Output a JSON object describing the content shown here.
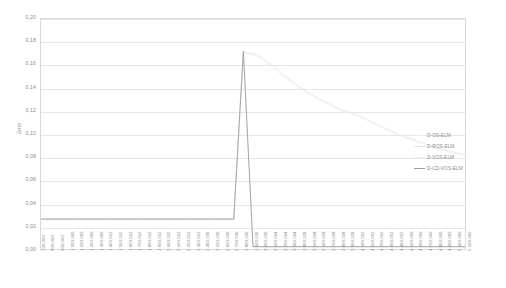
{
  "chart_data": {
    "type": "line",
    "title": "",
    "xlabel": "",
    "ylabel": "Error",
    "ylim": [
      0.0,
      0.2
    ],
    "y_ticks": [
      "0,20",
      "0,18",
      "0,16",
      "0,14",
      "0,12",
      "0,10",
      "0,08",
      "0,06",
      "0,04",
      "0,02",
      "0,00"
    ],
    "y_tick_values": [
      0.2,
      0.18,
      0.16,
      0.14,
      0.12,
      0.1,
      0.08,
      0.06,
      0.04,
      0.02,
      0.0
    ],
    "grid": true,
    "legend_position": "right",
    "decimal_separator": ",",
    "categories": [
      "700,060",
      "800,060",
      "900,060",
      "1.000,060",
      "1.100,060",
      "1.200,060",
      "1.300,060",
      "1.400,012",
      "1.500,012",
      "1.600,012",
      "1.700,012",
      "1.800,012",
      "1.900,012",
      "2.000,012",
      "2.100,012",
      "2.200,012",
      "2.300,012",
      "2.400,036",
      "2.500,036",
      "2.600,036",
      "2.700,036",
      "2.800,036",
      "2.900,036",
      "3.000,036",
      "3.100,004",
      "3.200,004",
      "3.300,004",
      "3.400,028",
      "3.500,028",
      "3.600,028",
      "3.700,028",
      "3.800,028",
      "3.900,028",
      "4.000,052",
      "4.100,052",
      "4.200,052",
      "4.300,052",
      "4.400,052",
      "4.500,000",
      "4.600,000",
      "4.700,000",
      "4.800,000",
      "4.900,060",
      "5.000,060",
      "5.100,060"
    ],
    "series": [
      {
        "name": "D-OS-ELM",
        "color": "#ededed",
        "values": [
          0.026,
          0.026,
          0.026,
          0.026,
          0.026,
          0.026,
          0.026,
          0.026,
          0.026,
          0.026,
          0.026,
          0.026,
          0.026,
          0.026,
          0.026,
          0.026,
          0.026,
          0.026,
          0.026,
          0.026,
          0.026,
          0.172,
          0.002,
          0.002,
          0.002,
          0.002,
          0.002,
          0.002,
          0.002,
          0.002,
          0.002,
          0.002,
          0.002,
          0.002,
          0.002,
          0.002,
          0.002,
          0.002,
          0.002,
          0.002,
          0.002,
          0.002,
          0.002,
          0.002,
          0.002
        ]
      },
      {
        "name": "D-ROS-ELM",
        "color": "#e4e4e4",
        "values": [
          0.026,
          0.026,
          0.026,
          0.026,
          0.026,
          0.026,
          0.026,
          0.026,
          0.026,
          0.026,
          0.026,
          0.026,
          0.026,
          0.026,
          0.026,
          0.026,
          0.026,
          0.026,
          0.026,
          0.026,
          0.026,
          0.171,
          0.17,
          0.166,
          0.16,
          0.153,
          0.146,
          0.14,
          0.135,
          0.13,
          0.126,
          0.122,
          0.119,
          0.116,
          0.112,
          0.108,
          0.104,
          0.1,
          0.097,
          0.094,
          0.091,
          0.088,
          0.086,
          0.084,
          0.082
        ]
      },
      {
        "name": "D-VOS-ELM",
        "color": "#efefef",
        "values": [
          0.026,
          0.026,
          0.026,
          0.026,
          0.026,
          0.026,
          0.026,
          0.026,
          0.026,
          0.026,
          0.026,
          0.026,
          0.026,
          0.026,
          0.026,
          0.026,
          0.026,
          0.026,
          0.026,
          0.026,
          0.026,
          0.17,
          0.169,
          0.165,
          0.158,
          0.151,
          0.145,
          0.139,
          0.134,
          0.129,
          0.125,
          0.121,
          0.118,
          0.115,
          0.111,
          0.107,
          0.103,
          0.099,
          0.096,
          0.093,
          0.09,
          0.087,
          0.085,
          0.083,
          0.081
        ]
      },
      {
        "name": "D-CD-VOS-ELM",
        "color": "#9d9d9d",
        "values": [
          0.026,
          0.026,
          0.026,
          0.026,
          0.026,
          0.026,
          0.026,
          0.026,
          0.026,
          0.026,
          0.026,
          0.026,
          0.026,
          0.026,
          0.026,
          0.026,
          0.026,
          0.026,
          0.026,
          0.026,
          0.026,
          0.172,
          0.002,
          0.002,
          0.002,
          0.002,
          0.002,
          0.002,
          0.002,
          0.002,
          0.002,
          0.002,
          0.002,
          0.002,
          0.002,
          0.002,
          0.002,
          0.002,
          0.002,
          0.002,
          0.002,
          0.002,
          0.002,
          0.002,
          0.002
        ]
      }
    ],
    "legend": [
      {
        "label": "D-OS-ELM",
        "style": "faint"
      },
      {
        "label": "D-ROS-ELM",
        "style": "normal"
      },
      {
        "label": "D-VOS-ELM",
        "style": "faint"
      },
      {
        "label": "D-CD-VOS-ELM",
        "style": "strong"
      }
    ]
  }
}
